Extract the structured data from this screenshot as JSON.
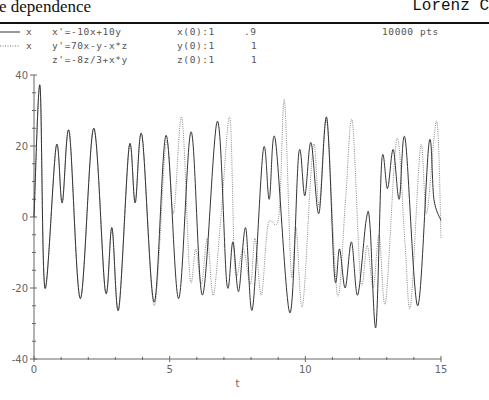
{
  "header": {
    "title_left": "e dependence",
    "title_right": "Lorenz C"
  },
  "legend": [
    {
      "style": "solid",
      "label": "x"
    },
    {
      "style": "dotted",
      "label": "x"
    }
  ],
  "equations": [
    "x'=-10x+10y",
    "y'=70x-y-x*z",
    "z'=-8z/3+x*y"
  ],
  "initial_conditions": [
    {
      "label": "x(0):1",
      "alt": ".9"
    },
    {
      "label": "y(0):1",
      "alt": "1"
    },
    {
      "label": "z(0):1",
      "alt": "1"
    }
  ],
  "points_label": "10000 pts",
  "chart_data": {
    "type": "line",
    "xlabel": "t",
    "ylabel": "",
    "xlim": [
      0,
      15
    ],
    "ylim": [
      -40,
      40
    ],
    "xticks": [
      0,
      5,
      10,
      15
    ],
    "yticks": [
      -40,
      -20,
      0,
      20,
      40
    ],
    "grid": false,
    "legend_position": "top-left",
    "series": [
      {
        "name": "x (x(0)=1)",
        "style": "solid",
        "t": [
          0,
          0.22,
          0.4,
          0.82,
          1.04,
          1.3,
          1.71,
          2.2,
          2.63,
          2.87,
          3.12,
          3.51,
          3.73,
          3.98,
          4.43,
          4.87,
          5.33,
          5.79,
          6.21,
          6.76,
          7.11,
          7.33,
          7.54,
          7.8,
          8.05,
          8.45,
          8.67,
          8.89,
          9.43,
          9.76,
          9.98,
          10.21,
          10.5,
          10.79,
          11.08,
          11.26,
          11.47,
          11.7,
          11.93,
          12.24,
          12.38,
          12.6,
          12.82,
          13.03,
          13.24,
          13.46,
          13.68,
          14.14,
          14.56,
          14.74,
          15
        ],
        "values": [
          0,
          37,
          -20,
          20,
          4,
          24,
          -23,
          25,
          -21,
          -3,
          -26,
          20,
          4,
          23,
          -24,
          23,
          -23,
          24,
          -22,
          27,
          -19,
          -7,
          -21,
          -3,
          -26,
          19,
          5,
          22,
          -27,
          18,
          6,
          21,
          1,
          28,
          -17,
          -9,
          -20,
          -7,
          -22,
          -1,
          -2,
          -31,
          16,
          8,
          19,
          5,
          22,
          -25,
          21,
          5,
          -1
        ]
      },
      {
        "name": "x (x(0)=.9)",
        "style": "dotted",
        "t": [
          0,
          0.22,
          0.4,
          0.82,
          1.04,
          1.3,
          1.71,
          2.2,
          2.63,
          2.87,
          3.12,
          3.51,
          3.73,
          3.98,
          4.43,
          4.87,
          5.14,
          5.45,
          5.75,
          5.96,
          6.17,
          6.39,
          6.61,
          6.9,
          7.22,
          7.41,
          7.71,
          7.98,
          8.15,
          8.38,
          8.63,
          9.02,
          9.23,
          9.48,
          9.66,
          9.9,
          10.29,
          10.51,
          10.79,
          11.18,
          11.49,
          11.73,
          12.04,
          12.28,
          12.5,
          12.72,
          12.96,
          13.37,
          13.67,
          13.88,
          14.25,
          14.47,
          14.84,
          15
        ],
        "values": [
          0,
          37,
          -20,
          20,
          4,
          24,
          -23,
          25,
          -21,
          -3,
          -26,
          20,
          4,
          23,
          -25,
          21,
          1,
          28,
          -17,
          -9,
          -19,
          -6,
          -22,
          1,
          28,
          -15,
          -9,
          -19,
          -6,
          -22,
          -2,
          0,
          33,
          -16,
          -3,
          -25,
          20,
          3,
          27,
          -22,
          6,
          27,
          -18,
          -8,
          -20,
          -5,
          -24,
          22,
          -7,
          -25,
          20,
          1,
          27,
          -6
        ]
      }
    ]
  },
  "axis": {
    "x_tick_labels": [
      "0",
      "5",
      "10",
      "15"
    ],
    "y_tick_labels": [
      "40",
      "20",
      "0",
      "-20",
      "-40"
    ],
    "x_label": "t"
  }
}
